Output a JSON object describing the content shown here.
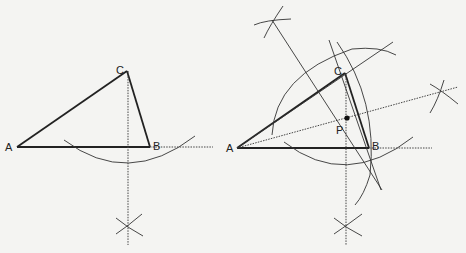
{
  "figure_left": {
    "labels": {
      "A": "A",
      "B": "B",
      "C": "C"
    }
  },
  "figure_right": {
    "labels": {
      "A": "A",
      "B": "B",
      "C": "C",
      "P": "P"
    }
  },
  "colors": {
    "background": "#f4f4f2",
    "stroke": "#222222"
  }
}
